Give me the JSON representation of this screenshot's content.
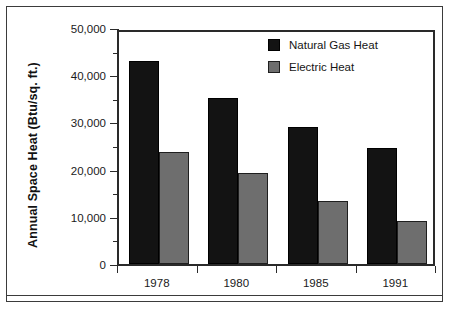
{
  "chart_data": {
    "type": "bar",
    "title": "",
    "xlabel": "",
    "ylabel": "Annual Space Heat (Btu/sq. ft.)",
    "categories": [
      "1978",
      "1980",
      "1985",
      "1991"
    ],
    "series": [
      {
        "name": "Natural Gas Heat",
        "color": "#131313",
        "values": [
          43000,
          35200,
          29000,
          24600
        ]
      },
      {
        "name": "Electric Heat",
        "color": "#6e6e6e",
        "values": [
          23800,
          19300,
          13300,
          9100
        ]
      }
    ],
    "ylim": [
      0,
      50000
    ],
    "ytick_values": [
      0,
      10000,
      20000,
      30000,
      40000,
      50000
    ],
    "ytick_labels": [
      "0",
      "10,000",
      "20,000",
      "30,000",
      "40,000",
      "50,000"
    ],
    "yminor_values": [
      5000,
      15000,
      25000,
      35000,
      45000
    ],
    "grid": false,
    "legend_position": "top-right"
  },
  "legend": {
    "entries": [
      {
        "label": "Natural Gas Heat"
      },
      {
        "label": "Electric Heat"
      }
    ]
  }
}
